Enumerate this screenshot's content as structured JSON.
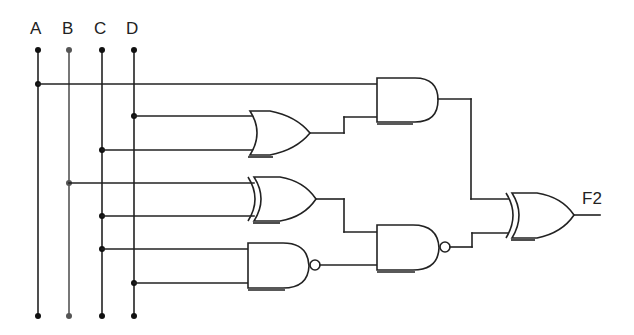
{
  "diagram": {
    "type": "combinational-logic-circuit",
    "inputs": [
      {
        "label": "A"
      },
      {
        "label": "B"
      },
      {
        "label": "C"
      },
      {
        "label": "D"
      }
    ],
    "output": {
      "label": "F2"
    },
    "gates": [
      {
        "id": "g1",
        "type": "OR",
        "inputs": [
          "D",
          "C"
        ]
      },
      {
        "id": "g2",
        "type": "AND",
        "inputs": [
          "A",
          "g1"
        ]
      },
      {
        "id": "g3",
        "type": "XOR",
        "inputs": [
          "B",
          "C"
        ]
      },
      {
        "id": "g4",
        "type": "NAND",
        "inputs": [
          "C",
          "D"
        ]
      },
      {
        "id": "g5",
        "type": "NAND",
        "inputs": [
          "g3",
          "g4"
        ]
      },
      {
        "id": "g6",
        "type": "XOR",
        "inputs": [
          "g2",
          "g5"
        ],
        "output": "F2"
      }
    ]
  }
}
